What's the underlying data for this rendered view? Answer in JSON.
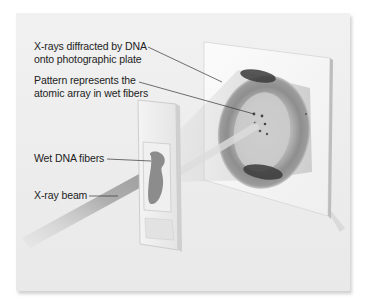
{
  "figure": {
    "labels": {
      "diffracted_line1": "X-rays diffracted by DNA",
      "diffracted_line2": "onto photographic plate",
      "pattern_line1": "Pattern represents the",
      "pattern_line2": "atomic array in wet fibers",
      "fibers": "Wet DNA fibers",
      "beam": "X-ray beam"
    },
    "components": [
      "x-ray-beam",
      "glass-slide-with-wet-dna-fibers",
      "diffracted-rays-cone",
      "photographic-plate",
      "diffraction-pattern"
    ],
    "colors": {
      "background": "#ececec",
      "plate": "#f7f7f7",
      "pattern_ring": "#7a7a7a",
      "pattern_dark": "#3a3a3a",
      "fiber_blob": "#8a8a8a",
      "leader_line": "#333333",
      "text": "#222222"
    }
  }
}
